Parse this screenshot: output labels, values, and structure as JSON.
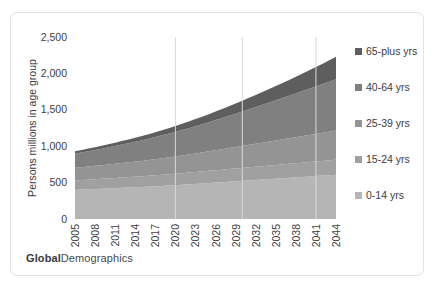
{
  "brand": {
    "bold_part": "Global",
    "regular_part": "Demographics"
  },
  "chart_data": {
    "type": "area",
    "stacked": true,
    "title": "",
    "xlabel": "",
    "ylabel": "Persons millions in age group",
    "ylim": [
      0,
      2500
    ],
    "yticks": [
      0,
      500,
      1000,
      1500,
      2000,
      2500
    ],
    "ytick_labels": [
      "0",
      "500",
      "1,000",
      "1,500",
      "2,000",
      "2,500"
    ],
    "grid": "vertical-only",
    "gridline_years": [
      2020,
      2030,
      2041
    ],
    "legend_position": "right",
    "xlim": [
      2005,
      2044
    ],
    "xtick_labels": [
      "2005",
      "2008",
      "2011",
      "2014",
      "2017",
      "2020",
      "2023",
      "2026",
      "2029",
      "2032",
      "2035",
      "2038",
      "2041",
      "2044"
    ],
    "x": [
      2005,
      2006,
      2007,
      2008,
      2009,
      2010,
      2011,
      2012,
      2013,
      2014,
      2015,
      2016,
      2017,
      2018,
      2019,
      2020,
      2021,
      2022,
      2023,
      2024,
      2025,
      2026,
      2027,
      2028,
      2029,
      2030,
      2031,
      2032,
      2033,
      2034,
      2035,
      2036,
      2037,
      2038,
      2039,
      2040,
      2041,
      2042,
      2043,
      2044
    ],
    "series": [
      {
        "name": "0-14 yrs",
        "color": "#b5b5b5",
        "values": [
          400,
          404,
          408,
          412,
          416,
          420,
          424,
          428,
          432,
          436,
          440,
          445,
          450,
          455,
          460,
          465,
          470,
          476,
          482,
          488,
          494,
          500,
          506,
          512,
          518,
          524,
          530,
          536,
          542,
          548,
          554,
          560,
          566,
          572,
          578,
          584,
          590,
          596,
          602,
          608
        ]
      },
      {
        "name": "15-24 yrs",
        "color": "#a0a0a0",
        "values": [
          128,
          130,
          132,
          134,
          136,
          138,
          140,
          142,
          144,
          146,
          148,
          150,
          152,
          154,
          156,
          158,
          160,
          162,
          164,
          166,
          168,
          170,
          172,
          174,
          176,
          178,
          180,
          182,
          184,
          186,
          188,
          190,
          192,
          194,
          196,
          198,
          200,
          202,
          204,
          206
        ]
      },
      {
        "name": "25-39 yrs",
        "color": "#949494",
        "values": [
          175,
          178,
          181,
          184,
          187,
          190,
          194,
          198,
          202,
          206,
          210,
          215,
          220,
          225,
          230,
          236,
          242,
          248,
          254,
          260,
          267,
          274,
          281,
          288,
          295,
          302,
          309,
          316,
          323,
          330,
          337,
          344,
          351,
          358,
          365,
          372,
          379,
          386,
          393,
          400
        ]
      },
      {
        "name": "40-64 yrs",
        "color": "#808080",
        "values": [
          195,
          203,
          211,
          219,
          227,
          236,
          245,
          254,
          263,
          273,
          283,
          293,
          304,
          315,
          326,
          338,
          350,
          362,
          375,
          388,
          401,
          415,
          429,
          443,
          458,
          473,
          488,
          503,
          519,
          535,
          551,
          567,
          584,
          601,
          618,
          635,
          652,
          670,
          688,
          706
        ]
      },
      {
        "name": "65-plus yrs",
        "color": "#5e5e5e",
        "values": [
          32,
          34,
          36,
          38,
          40,
          42,
          45,
          48,
          51,
          54,
          58,
          62,
          66,
          70,
          75,
          80,
          85,
          91,
          97,
          103,
          110,
          117,
          124,
          132,
          140,
          148,
          157,
          166,
          176,
          186,
          196,
          207,
          218,
          230,
          242,
          254,
          267,
          280,
          294,
          308
        ]
      }
    ],
    "legend_entries": [
      {
        "label": "65-plus yrs",
        "color": "#5e5e5e"
      },
      {
        "label": "40-64 yrs",
        "color": "#808080"
      },
      {
        "label": "25-39 yrs",
        "color": "#949494"
      },
      {
        "label": "15-24 yrs",
        "color": "#a0a0a0"
      },
      {
        "label": "0-14 yrs",
        "color": "#b5b5b5"
      }
    ]
  }
}
